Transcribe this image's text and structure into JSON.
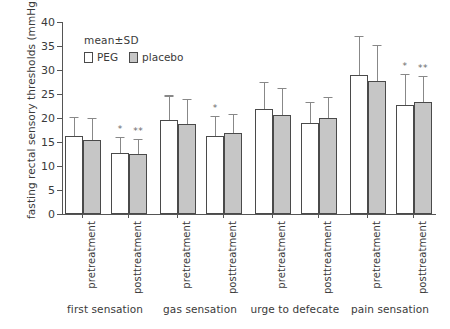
{
  "chart_data": {
    "type": "bar",
    "title": "",
    "subtitle": "",
    "xlabel": "",
    "ylabel": "fasting rectal  sensory thresholds  (mmHg)",
    "ylim": [
      0,
      40
    ],
    "yticks": [
      0,
      5,
      10,
      15,
      20,
      25,
      30,
      35,
      40
    ],
    "ytick_labels": [
      "0",
      "5",
      "10",
      "15",
      "20",
      "25",
      "30",
      "35",
      "40"
    ],
    "grid": false,
    "legend_position": "upper-left-inside",
    "annotations": {
      "mean_sd": "mean±SD",
      "significance_note_single": "*",
      "significance_note_double": "**"
    },
    "legend": [
      {
        "name": "PEG",
        "fill": "#ffffff",
        "edge": "#4a4a4a"
      },
      {
        "name": "placebo",
        "fill": "#c6c6c6",
        "edge": "#4a4a4a"
      }
    ],
    "groups": [
      "first sensation",
      "gas sensation",
      "urge to defecate",
      "pain sensation"
    ],
    "timepoints": [
      "pretreatment",
      "posttreatment"
    ],
    "categories": [
      "first sensation pretreatment",
      "first sensation posttreatment",
      "gas sensation pretreatment",
      "gas sensation posttreatment",
      "urge to defecate pretreatment",
      "urge to defecate posttreatment",
      "pain sensation pretreatment",
      "pain sensation posttreatment"
    ],
    "series": [
      {
        "name": "PEG",
        "values": [
          16.2,
          12.7,
          19.5,
          16.2,
          21.8,
          19.0,
          29.0,
          22.7
        ],
        "errors": [
          4.0,
          3.3,
          5.2,
          4.3,
          5.7,
          4.4,
          8.0,
          6.5
        ],
        "significance": [
          "",
          "*",
          "",
          "*",
          "",
          "",
          "",
          "*"
        ]
      },
      {
        "name": "placebo",
        "values": [
          15.4,
          12.4,
          18.8,
          16.8,
          20.7,
          19.9,
          27.8,
          23.4
        ],
        "errors": [
          4.6,
          3.2,
          5.2,
          4.1,
          5.5,
          4.4,
          7.5,
          5.3
        ],
        "significance": [
          "",
          "**",
          "",
          "",
          "",
          "",
          "",
          "**"
        ]
      }
    ]
  },
  "axis": {
    "y_title": "fasting rectal  sensory thresholds  (mmHg)"
  },
  "legend_box": {
    "title": "mean±SD",
    "peg_label": "PEG",
    "placebo_label": "placebo"
  },
  "colors": {
    "peg_fill": "#ffffff",
    "placebo_fill": "#c6c6c6",
    "bar_edge": "#4a4a4a",
    "error_bar": "#888888",
    "axis": "#555555",
    "text": "#3a3a3a",
    "background": "#ffffff"
  }
}
